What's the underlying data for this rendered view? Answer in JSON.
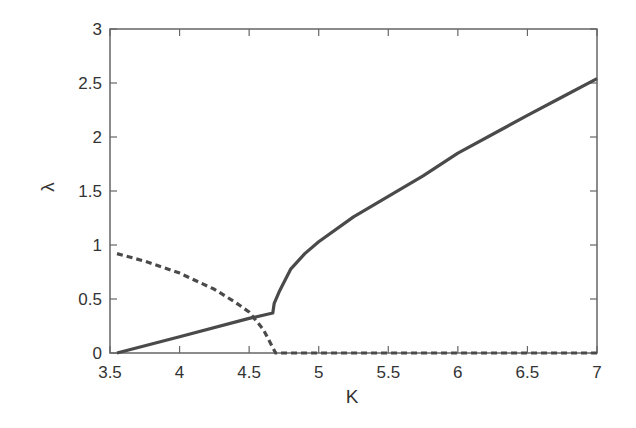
{
  "chart_data": {
    "type": "line",
    "title": "",
    "xlabel": "K",
    "ylabel": "λ",
    "xlim": [
      3.5,
      7
    ],
    "ylim": [
      0,
      3
    ],
    "xticks": [
      3.5,
      4,
      4.5,
      5,
      5.5,
      6,
      6.5,
      7
    ],
    "xtick_labels": [
      "3.5",
      "4",
      "4.5",
      "5",
      "5.5",
      "6",
      "6.5",
      "7"
    ],
    "yticks": [
      0,
      0.5,
      1,
      1.5,
      2,
      2.5,
      3
    ],
    "ytick_labels": [
      "0",
      "0.5",
      "1",
      "1.5",
      "2",
      "2.5",
      "3"
    ],
    "grid": false,
    "legend": null,
    "series": [
      {
        "name": "solid",
        "style": "solid",
        "color": "#4a4a4a",
        "x": [
          3.55,
          4.0,
          4.5,
          4.67,
          4.68,
          4.72,
          4.8,
          4.9,
          5.0,
          5.25,
          5.5,
          5.75,
          6.0,
          6.3,
          6.5,
          6.75,
          7.0
        ],
        "y": [
          0.0,
          0.15,
          0.32,
          0.37,
          0.46,
          0.58,
          0.78,
          0.92,
          1.03,
          1.26,
          1.45,
          1.64,
          1.85,
          2.06,
          2.2,
          2.37,
          2.54
        ]
      },
      {
        "name": "dashed",
        "style": "dashed",
        "color": "#4a4a4a",
        "x": [
          3.55,
          3.75,
          4.0,
          4.25,
          4.4,
          4.5,
          4.6,
          4.65,
          4.69,
          5.0,
          6.0,
          7.0
        ],
        "y": [
          0.92,
          0.85,
          0.74,
          0.59,
          0.47,
          0.38,
          0.22,
          0.1,
          0.0,
          0.0,
          0.0,
          0.0
        ]
      }
    ]
  },
  "colors": {
    "line": "#4a4a4a",
    "axis": "#666666",
    "text": "#333333",
    "background": "#ffffff"
  }
}
